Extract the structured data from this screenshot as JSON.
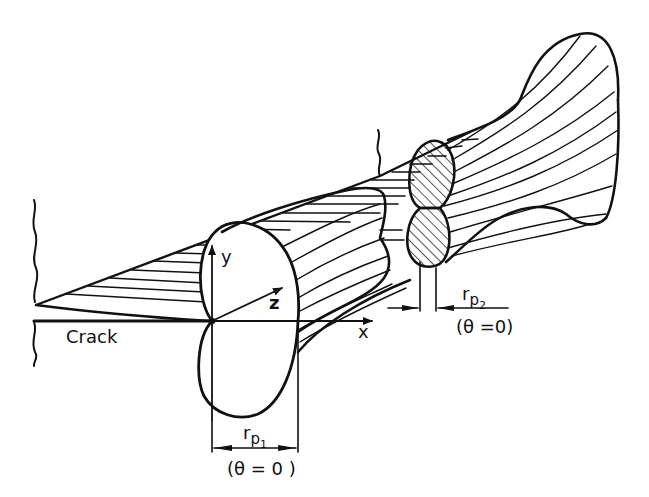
{
  "figure": {
    "type": "technical-illustration",
    "stroke_color": "#111111",
    "background_color": "#ffffff"
  },
  "labels": {
    "crack": "Crack",
    "axis_x": "x",
    "axis_y": "y",
    "axis_z": "z",
    "rp1_r": "r",
    "rp1_p": "p",
    "rp1_sub": "1",
    "rp1_condition": "(θ = 0 )",
    "rp2_r": "r",
    "rp2_p": "p",
    "rp2_sub": "2",
    "rp2_condition": "(θ =0)"
  },
  "elements": {
    "crack_plane": "hatched wedge crack plane",
    "surface_zone": "large two-lobed plastic zone at free surface (plane stress), width r_p1",
    "interior_zone": "small hatched two-lobed zone at mid-thickness (plane strain), width r_p2",
    "far_surface_zone": "flared plastic zone at opposite surface"
  }
}
